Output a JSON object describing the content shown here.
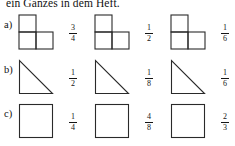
{
  "document": {
    "heading": "ein Ganzes in dem Heft.",
    "stroke_color": "#2a2a2a",
    "text_color": "#151515",
    "background_color": "#ffffff"
  },
  "rows": [
    {
      "label": "a)",
      "shape": "l-tromino",
      "items": [
        {
          "numerator": "3",
          "denominator": "4"
        },
        {
          "numerator": "1",
          "denominator": "2"
        },
        {
          "numerator": "1",
          "denominator": "6"
        }
      ]
    },
    {
      "label": "b)",
      "shape": "right-triangle",
      "items": [
        {
          "numerator": "1",
          "denominator": "2"
        },
        {
          "numerator": "1",
          "denominator": "8"
        },
        {
          "numerator": "1",
          "denominator": "6"
        }
      ]
    },
    {
      "label": "c)",
      "shape": "square",
      "items": [
        {
          "numerator": "1",
          "denominator": "4"
        },
        {
          "numerator": "4",
          "denominator": "8"
        },
        {
          "numerator": "2",
          "denominator": "3"
        }
      ]
    }
  ]
}
